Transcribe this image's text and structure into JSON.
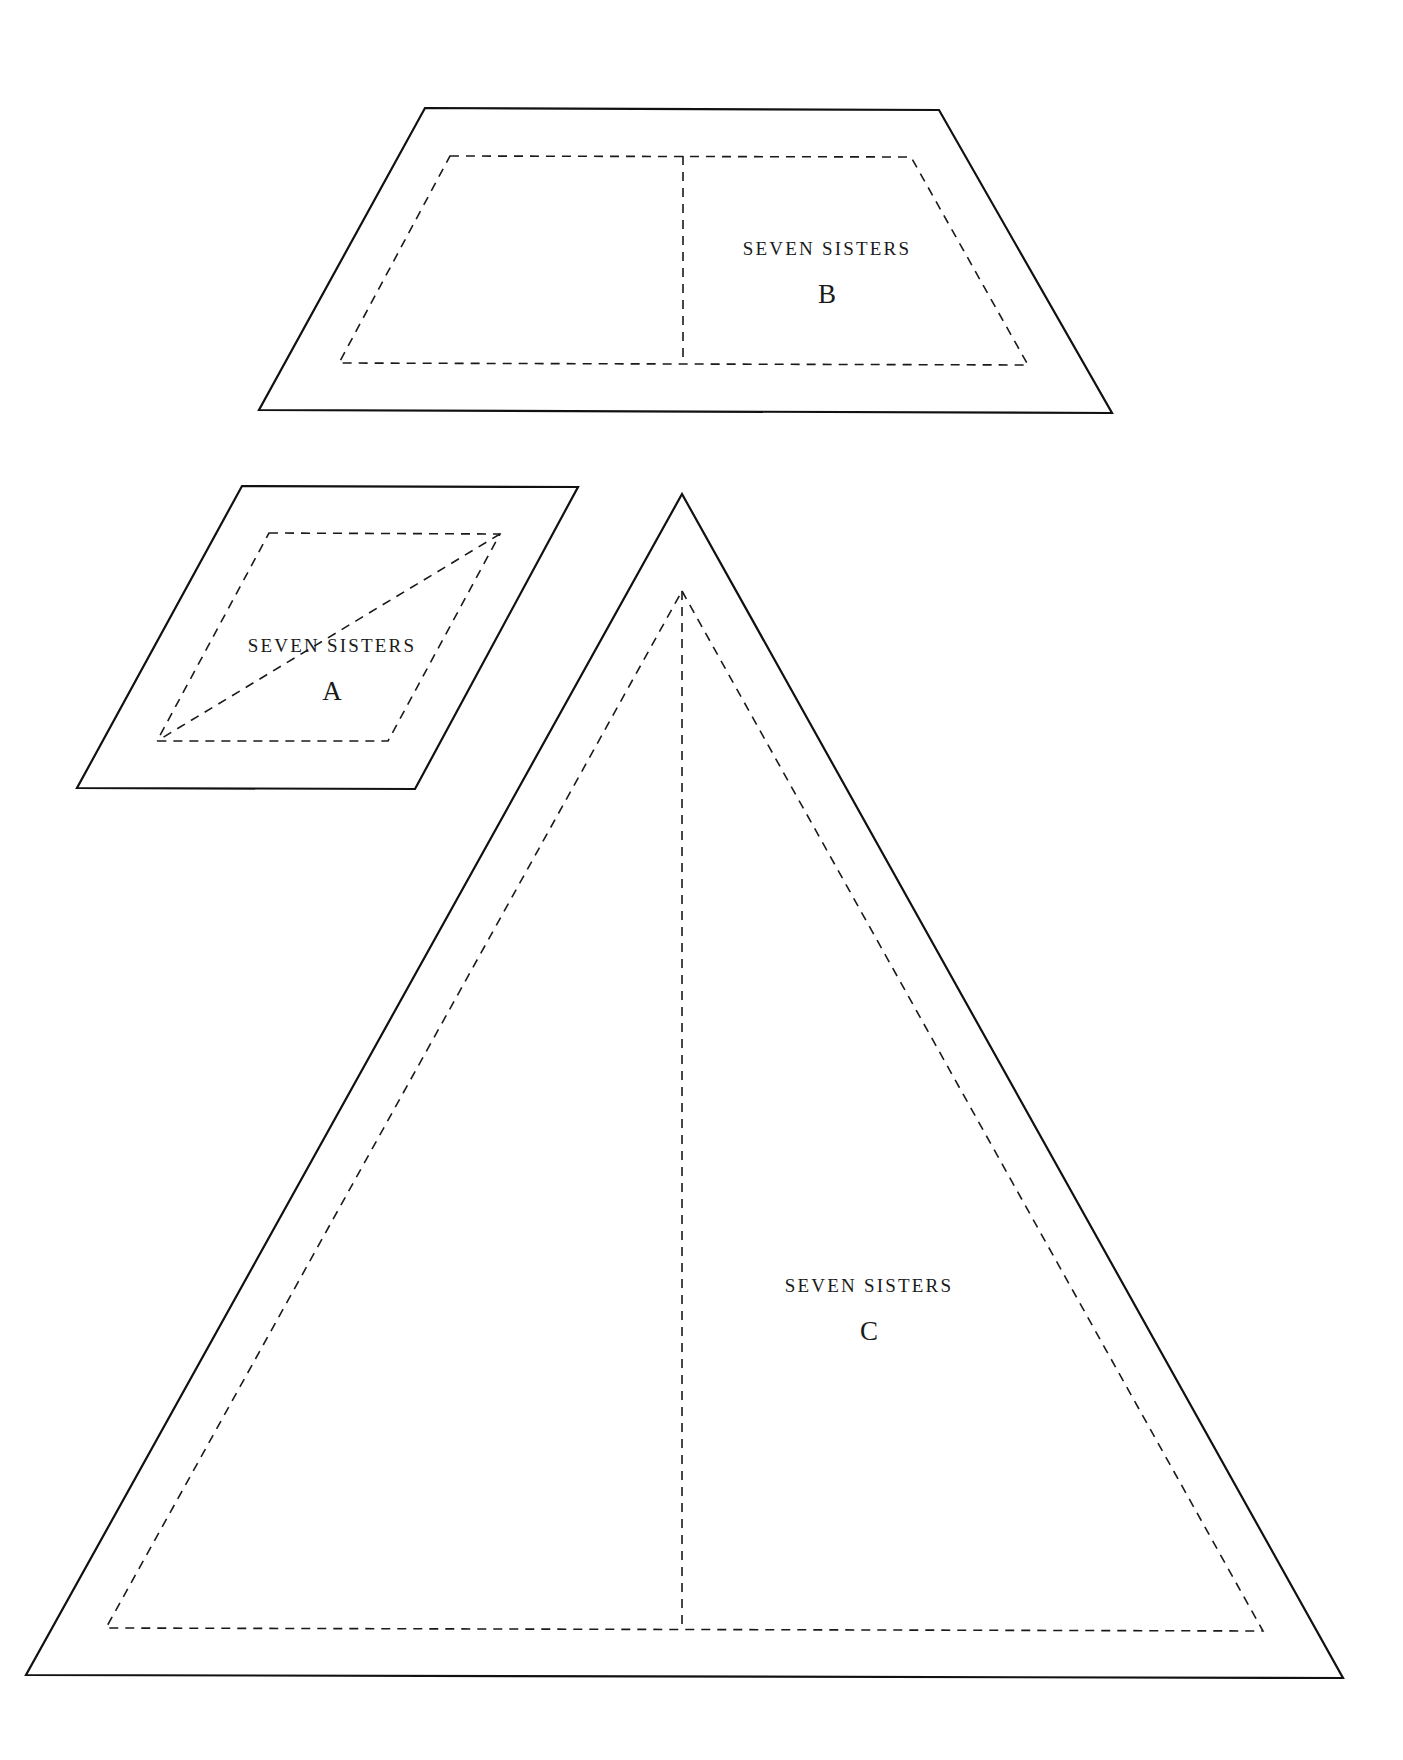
{
  "page": {
    "background": "#ffffff",
    "stroke_color": "#111111"
  },
  "templates": [
    {
      "id": "B",
      "title": "SEVEN SISTERS",
      "letter": "B",
      "shape": "trapezoid",
      "outline": [
        [
          425,
          108
        ],
        [
          939,
          110
        ],
        [
          1112,
          413
        ],
        [
          259,
          410
        ]
      ],
      "seam": [
        [
          450,
          156
        ],
        [
          911,
          157
        ],
        [
          1028,
          365
        ],
        [
          339,
          363
        ]
      ],
      "guides": [
        [
          [
            683,
            156
          ],
          [
            683,
            364
          ]
        ]
      ],
      "title_pos": [
        827,
        255
      ],
      "letter_pos": [
        827,
        303
      ]
    },
    {
      "id": "A",
      "title": "SEVEN SISTERS",
      "letter": "A",
      "shape": "parallelogram",
      "outline": [
        [
          242,
          486
        ],
        [
          578,
          487
        ],
        [
          415,
          789
        ],
        [
          77,
          788
        ]
      ],
      "seam": [
        [
          269,
          533
        ],
        [
          500,
          534
        ],
        [
          388,
          741
        ],
        [
          157,
          741
        ]
      ],
      "guides": [
        [
          [
            500,
            534
          ],
          [
            157,
            741
          ]
        ]
      ],
      "title_pos": [
        332,
        652
      ],
      "letter_pos": [
        332,
        700
      ]
    },
    {
      "id": "C",
      "title": "SEVEN SISTERS",
      "letter": "C",
      "shape": "triangle",
      "outline": [
        [
          682,
          494
        ],
        [
          1343,
          1678
        ],
        [
          26,
          1675
        ]
      ],
      "seam": [
        [
          682,
          591
        ],
        [
          1263,
          1631
        ],
        [
          106,
          1628
        ]
      ],
      "guides": [
        [
          [
            682,
            591
          ],
          [
            682,
            1629
          ]
        ]
      ],
      "title_pos": [
        869,
        1292
      ],
      "letter_pos": [
        869,
        1340
      ]
    }
  ]
}
